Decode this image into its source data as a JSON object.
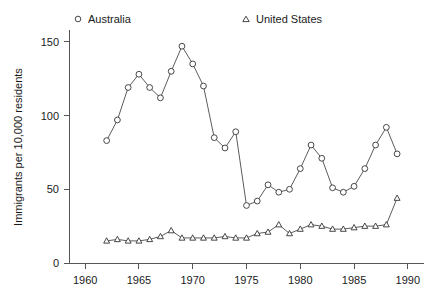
{
  "chart_data": {
    "type": "line",
    "title": "",
    "xlabel": "",
    "ylabel": "Immigrants per 10,000 residents",
    "xlim": [
      1958.5,
      1991.5
    ],
    "ylim": [
      0,
      158
    ],
    "xticks": [
      1960,
      1965,
      1970,
      1975,
      1980,
      1985,
      1990
    ],
    "xticklabels": [
      "1960",
      "1965",
      "1970",
      "1975",
      "1980",
      "1985",
      "1990"
    ],
    "yticks": [
      0,
      50,
      100,
      150
    ],
    "yticklabels": [
      "0",
      "50",
      "100",
      "150"
    ],
    "grid": false,
    "legend_position": "top",
    "x": [
      1962,
      1963,
      1964,
      1965,
      1966,
      1967,
      1968,
      1969,
      1970,
      1971,
      1972,
      1973,
      1974,
      1975,
      1976,
      1977,
      1978,
      1979,
      1980,
      1981,
      1982,
      1983,
      1984,
      1985,
      1986,
      1987,
      1988,
      1989
    ],
    "series": [
      {
        "name": "Australia",
        "marker": "circle",
        "values": [
          83,
          97,
          119,
          128,
          119,
          112,
          130,
          147,
          135,
          120,
          85,
          78,
          89,
          39,
          42,
          53,
          48,
          50,
          64,
          80,
          71,
          51,
          48,
          52,
          64,
          80,
          92,
          74
        ]
      },
      {
        "name": "United States",
        "marker": "triangle",
        "values": [
          15,
          16,
          15,
          15,
          16,
          18,
          22,
          17,
          17,
          17,
          17,
          18,
          17,
          17,
          20,
          21,
          26,
          20,
          23,
          26,
          25,
          23,
          23,
          24,
          25,
          25,
          26,
          44
        ]
      }
    ]
  },
  "legend": {
    "items": [
      {
        "label": "Australia",
        "marker": "circle"
      },
      {
        "label": "United States",
        "marker": "triangle"
      }
    ]
  },
  "axes": {
    "y_title": "Immigrants per 10,000 residents"
  }
}
